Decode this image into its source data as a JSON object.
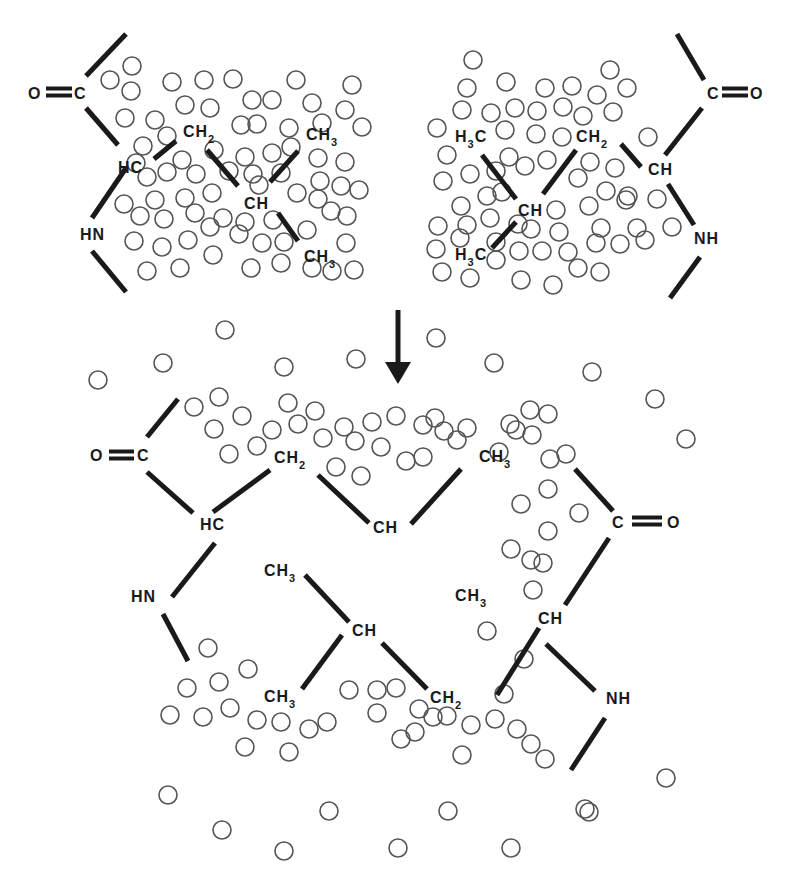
{
  "diagram": {
    "title": "Hydrophobic interaction between leucine side chains releasing ordered water",
    "colors": {
      "ink": "#1a1a1a",
      "water_stroke": "#555555",
      "background": "#ffffff"
    },
    "water_radius": 9,
    "labels": [
      {
        "id": "tl-o",
        "text": "O",
        "x": 28,
        "y": 99
      },
      {
        "id": "tl-c",
        "text": "C",
        "x": 74,
        "y": 99
      },
      {
        "id": "tl-hc",
        "text": "HC",
        "x": 118,
        "y": 173
      },
      {
        "id": "tl-ch2",
        "text": "CH",
        "sub": "2",
        "x": 183,
        "y": 137
      },
      {
        "id": "tl-ch",
        "text": "CH",
        "x": 244,
        "y": 209
      },
      {
        "id": "tl-ch3-top",
        "text": "CH",
        "sub": "3",
        "x": 306,
        "y": 140
      },
      {
        "id": "tl-ch3-bot",
        "text": "CH",
        "sub": "3",
        "x": 304,
        "y": 262
      },
      {
        "id": "tl-hn",
        "text": "HN",
        "x": 80,
        "y": 240
      },
      {
        "id": "tr-c",
        "text": "C",
        "x": 707,
        "y": 99
      },
      {
        "id": "tr-o",
        "text": "O",
        "x": 750,
        "y": 99
      },
      {
        "id": "tr-ch",
        "text": "CH",
        "x": 648,
        "y": 175
      },
      {
        "id": "tr-ch2",
        "text": "CH",
        "sub": "2",
        "x": 576,
        "y": 142
      },
      {
        "id": "tr-ch",
        "text": "CH",
        "x": 518,
        "y": 216
      },
      {
        "id": "tr-h3c-top",
        "text": "H",
        "sub": "3",
        "tail": "C",
        "x": 455,
        "y": 142
      },
      {
        "id": "tr-h3c-bot",
        "text": "H",
        "sub": "3",
        "tail": "C",
        "x": 455,
        "y": 260
      },
      {
        "id": "tr-nh",
        "text": "NH",
        "x": 694,
        "y": 244
      },
      {
        "id": "b-o1",
        "text": "O",
        "x": 90,
        "y": 461
      },
      {
        "id": "b-c1",
        "text": "C",
        "x": 137,
        "y": 461
      },
      {
        "id": "b-hc",
        "text": "HC",
        "x": 200,
        "y": 530
      },
      {
        "id": "b-ch2-top",
        "text": "CH",
        "sub": "2",
        "x": 274,
        "y": 463
      },
      {
        "id": "b-ch-mid",
        "text": "CH",
        "x": 373,
        "y": 533
      },
      {
        "id": "b-ch3-topright",
        "text": "CH",
        "sub": "3",
        "x": 479,
        "y": 462
      },
      {
        "id": "b-ch3-midright",
        "text": "CH",
        "sub": "3",
        "x": 455,
        "y": 601
      },
      {
        "id": "b-c2",
        "text": "C",
        "x": 612,
        "y": 528
      },
      {
        "id": "b-o2",
        "text": "O",
        "x": 667,
        "y": 528
      },
      {
        "id": "b-hn",
        "text": "HN",
        "x": 131,
        "y": 602
      },
      {
        "id": "b-ch3-left",
        "text": "CH",
        "sub": "3",
        "x": 264,
        "y": 576
      },
      {
        "id": "b-ch-low",
        "text": "CH",
        "x": 352,
        "y": 636
      },
      {
        "id": "b-ch3-low",
        "text": "CH",
        "sub": "3",
        "x": 264,
        "y": 702
      },
      {
        "id": "b-ch2-low",
        "text": "CH",
        "sub": "2",
        "x": 430,
        "y": 703
      },
      {
        "id": "b-ch-right",
        "text": "CH",
        "x": 538,
        "y": 624
      },
      {
        "id": "b-nh",
        "text": "NH",
        "x": 606,
        "y": 704
      }
    ],
    "bonds": [
      [
        86,
        76,
        126,
        34
      ],
      [
        86,
        108,
        118,
        145
      ],
      [
        126,
        168,
        92,
        218
      ],
      [
        92,
        251,
        126,
        292
      ],
      [
        154,
        159,
        176,
        141
      ],
      [
        207,
        150,
        238,
        186
      ],
      [
        270,
        182,
        298,
        151
      ],
      [
        278,
        213,
        298,
        241
      ],
      [
        677,
        34,
        704,
        80
      ],
      [
        702,
        108,
        665,
        155
      ],
      [
        668,
        184,
        694,
        225
      ],
      [
        700,
        257,
        670,
        298
      ],
      [
        621,
        144,
        641,
        167
      ],
      [
        576,
        150,
        543,
        194
      ],
      [
        482,
        155,
        516,
        199
      ],
      [
        492,
        248,
        516,
        222
      ],
      [
        178,
        399,
        147,
        437
      ],
      [
        147,
        472,
        193,
        513
      ],
      [
        215,
        543,
        172,
        597
      ],
      [
        163,
        614,
        188,
        661
      ],
      [
        213,
        512,
        270,
        470
      ],
      [
        318,
        475,
        369,
        523
      ],
      [
        411,
        524,
        461,
        469
      ],
      [
        575,
        469,
        613,
        511
      ],
      [
        609,
        538,
        565,
        605
      ],
      [
        539,
        628,
        497,
        695
      ],
      [
        546,
        644,
        595,
        691
      ],
      [
        605,
        718,
        571,
        770
      ],
      [
        305,
        575,
        349,
        622
      ],
      [
        342,
        635,
        302,
        689
      ],
      [
        382,
        643,
        427,
        689
      ]
    ],
    "double_bonds": [
      {
        "x1": 46,
        "x2": 72,
        "y": 92
      },
      {
        "x1": 722,
        "x2": 748,
        "y": 92
      },
      {
        "x1": 109,
        "x2": 134,
        "y": 455
      },
      {
        "x1": 632,
        "x2": 662,
        "y": 521
      }
    ],
    "arrow": {
      "x": 398,
      "y1": 310,
      "y2": 384,
      "direction": "down"
    },
    "waters": [
      [
        132,
        66
      ],
      [
        110,
        80
      ],
      [
        131,
        91
      ],
      [
        172,
        82
      ],
      [
        204,
        80
      ],
      [
        233,
        79
      ],
      [
        296,
        80
      ],
      [
        352,
        85
      ],
      [
        125,
        118
      ],
      [
        155,
        120
      ],
      [
        185,
        105
      ],
      [
        210,
        108
      ],
      [
        252,
        100
      ],
      [
        272,
        100
      ],
      [
        312,
        103
      ],
      [
        345,
        110
      ],
      [
        167,
        136
      ],
      [
        143,
        146
      ],
      [
        241,
        125
      ],
      [
        257,
        124
      ],
      [
        289,
        128
      ],
      [
        322,
        123
      ],
      [
        362,
        127
      ],
      [
        136,
        163
      ],
      [
        182,
        160
      ],
      [
        214,
        150
      ],
      [
        245,
        157
      ],
      [
        272,
        153
      ],
      [
        291,
        147
      ],
      [
        318,
        158
      ],
      [
        345,
        162
      ],
      [
        147,
        177
      ],
      [
        167,
        172
      ],
      [
        196,
        174
      ],
      [
        229,
        171
      ],
      [
        253,
        174
      ],
      [
        281,
        173
      ],
      [
        320,
        181
      ],
      [
        341,
        186
      ],
      [
        124,
        204
      ],
      [
        155,
        200
      ],
      [
        185,
        198
      ],
      [
        212,
        193
      ],
      [
        259,
        185
      ],
      [
        297,
        193
      ],
      [
        318,
        199
      ],
      [
        359,
        190
      ],
      [
        140,
        216
      ],
      [
        164,
        219
      ],
      [
        195,
        213
      ],
      [
        223,
        218
      ],
      [
        245,
        222
      ],
      [
        273,
        220
      ],
      [
        331,
        211
      ],
      [
        347,
        216
      ],
      [
        134,
        241
      ],
      [
        162,
        247
      ],
      [
        188,
        240
      ],
      [
        210,
        227
      ],
      [
        239,
        234
      ],
      [
        262,
        243
      ],
      [
        284,
        242
      ],
      [
        307,
        230
      ],
      [
        346,
        243
      ],
      [
        147,
        271
      ],
      [
        180,
        268
      ],
      [
        213,
        255
      ],
      [
        251,
        268
      ],
      [
        281,
        263
      ],
      [
        312,
        268
      ],
      [
        332,
        271
      ],
      [
        354,
        270
      ],
      [
        473,
        60
      ],
      [
        467,
        88
      ],
      [
        506,
        82
      ],
      [
        545,
        88
      ],
      [
        572,
        86
      ],
      [
        610,
        70
      ],
      [
        597,
        95
      ],
      [
        627,
        88
      ],
      [
        462,
        110
      ],
      [
        491,
        113
      ],
      [
        515,
        108
      ],
      [
        537,
        111
      ],
      [
        563,
        107
      ],
      [
        583,
        116
      ],
      [
        613,
        112
      ],
      [
        437,
        128
      ],
      [
        505,
        130
      ],
      [
        536,
        134
      ],
      [
        562,
        137
      ],
      [
        648,
        137
      ],
      [
        447,
        155
      ],
      [
        509,
        157
      ],
      [
        547,
        160
      ],
      [
        590,
        162
      ],
      [
        615,
        168
      ],
      [
        443,
        181
      ],
      [
        470,
        174
      ],
      [
        496,
        171
      ],
      [
        525,
        166
      ],
      [
        578,
        178
      ],
      [
        606,
        191
      ],
      [
        628,
        196
      ],
      [
        461,
        206
      ],
      [
        487,
        196
      ],
      [
        502,
        192
      ],
      [
        556,
        210
      ],
      [
        589,
        206
      ],
      [
        626,
        200
      ],
      [
        657,
        199
      ],
      [
        438,
        226
      ],
      [
        467,
        225
      ],
      [
        490,
        218
      ],
      [
        518,
        224
      ],
      [
        531,
        229
      ],
      [
        559,
        232
      ],
      [
        601,
        228
      ],
      [
        637,
        228
      ],
      [
        672,
        227
      ],
      [
        436,
        249
      ],
      [
        460,
        238
      ],
      [
        496,
        242
      ],
      [
        519,
        251
      ],
      [
        542,
        251
      ],
      [
        568,
        252
      ],
      [
        596,
        243
      ],
      [
        620,
        244
      ],
      [
        645,
        240
      ],
      [
        442,
        272
      ],
      [
        470,
        278
      ],
      [
        496,
        260
      ],
      [
        521,
        280
      ],
      [
        553,
        285
      ],
      [
        578,
        268
      ],
      [
        600,
        272
      ],
      [
        225,
        330
      ],
      [
        163,
        363
      ],
      [
        98,
        380
      ],
      [
        284,
        367
      ],
      [
        356,
        359
      ],
      [
        436,
        338
      ],
      [
        494,
        363
      ],
      [
        592,
        372
      ],
      [
        655,
        399
      ],
      [
        686,
        439
      ],
      [
        194,
        407
      ],
      [
        219,
        397
      ],
      [
        242,
        416
      ],
      [
        288,
        403
      ],
      [
        315,
        411
      ],
      [
        344,
        427
      ],
      [
        372,
        422
      ],
      [
        396,
        416
      ],
      [
        423,
        425
      ],
      [
        444,
        431
      ],
      [
        467,
        428
      ],
      [
        510,
        424
      ],
      [
        532,
        435
      ],
      [
        550,
        459
      ],
      [
        566,
        454
      ],
      [
        214,
        429
      ],
      [
        229,
        454
      ],
      [
        257,
        446
      ],
      [
        272,
        430
      ],
      [
        298,
        424
      ],
      [
        323,
        438
      ],
      [
        355,
        441
      ],
      [
        381,
        447
      ],
      [
        406,
        461
      ],
      [
        423,
        457
      ],
      [
        435,
        418
      ],
      [
        457,
        440
      ],
      [
        499,
        452
      ],
      [
        516,
        430
      ],
      [
        530,
        410
      ],
      [
        548,
        414
      ],
      [
        336,
        467
      ],
      [
        361,
        476
      ],
      [
        548,
        489
      ],
      [
        521,
        504
      ],
      [
        579,
        513
      ],
      [
        548,
        531
      ],
      [
        543,
        563
      ],
      [
        511,
        549
      ],
      [
        531,
        560
      ],
      [
        533,
        590
      ],
      [
        487,
        631
      ],
      [
        524,
        659
      ],
      [
        504,
        694
      ],
      [
        531,
        744
      ],
      [
        585,
        809
      ],
      [
        666,
        778
      ],
      [
        208,
        648
      ],
      [
        248,
        669
      ],
      [
        187,
        688
      ],
      [
        219,
        682
      ],
      [
        230,
        708
      ],
      [
        170,
        715
      ],
      [
        203,
        717
      ],
      [
        257,
        720
      ],
      [
        281,
        722
      ],
      [
        309,
        729
      ],
      [
        327,
        722
      ],
      [
        349,
        690
      ],
      [
        377,
        690
      ],
      [
        396,
        688
      ],
      [
        377,
        713
      ],
      [
        419,
        709
      ],
      [
        433,
        717
      ],
      [
        415,
        732
      ],
      [
        447,
        716
      ],
      [
        471,
        725
      ],
      [
        495,
        719
      ],
      [
        517,
        729
      ],
      [
        401,
        739
      ],
      [
        245,
        747
      ],
      [
        289,
        752
      ],
      [
        462,
        755
      ],
      [
        545,
        759
      ],
      [
        168,
        795
      ],
      [
        222,
        830
      ],
      [
        284,
        851
      ],
      [
        329,
        811
      ],
      [
        398,
        848
      ],
      [
        448,
        811
      ],
      [
        511,
        848
      ],
      [
        589,
        812
      ]
    ]
  }
}
